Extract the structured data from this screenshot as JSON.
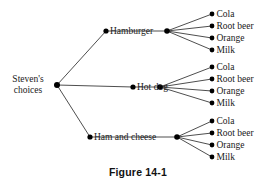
{
  "figure": {
    "caption": "Figure 14-1",
    "line_color": "#3a3a3a",
    "node_color": "#000000",
    "text_color": "#1a1a1a",
    "background": "#ffffff",
    "width": 276,
    "height": 186
  },
  "tree": {
    "root": {
      "label_line1": "Steven's",
      "label_line2": "choices",
      "x": 57,
      "y": 85
    },
    "branches": [
      {
        "label": "Hamburger",
        "left_dot_x": 106,
        "hub_x": 167,
        "y": 31,
        "label_x": 110,
        "leaves": [
          {
            "label": "Cola",
            "x": 212,
            "y": 14
          },
          {
            "label": "Root beer",
            "x": 212,
            "y": 26
          },
          {
            "label": "Orange",
            "x": 212,
            "y": 38
          },
          {
            "label": "Milk",
            "x": 212,
            "y": 50
          }
        ]
      },
      {
        "label": "Hot dog",
        "left_dot_x": 133,
        "hub_x": 160,
        "y": 87,
        "label_x": 137,
        "leaves": [
          {
            "label": "Cola",
            "x": 212,
            "y": 67
          },
          {
            "label": "Root beer",
            "x": 212,
            "y": 79
          },
          {
            "label": "Orange",
            "x": 212,
            "y": 91
          },
          {
            "label": "Milk",
            "x": 212,
            "y": 103
          }
        ]
      },
      {
        "label": "Ham and cheese",
        "left_dot_x": 90,
        "hub_x": 177,
        "y": 137,
        "label_x": 94,
        "leaves": [
          {
            "label": "Cola",
            "x": 212,
            "y": 121
          },
          {
            "label": "Root beer",
            "x": 212,
            "y": 133
          },
          {
            "label": "Orange",
            "x": 212,
            "y": 145
          },
          {
            "label": "Milk",
            "x": 212,
            "y": 157
          }
        ]
      }
    ]
  }
}
